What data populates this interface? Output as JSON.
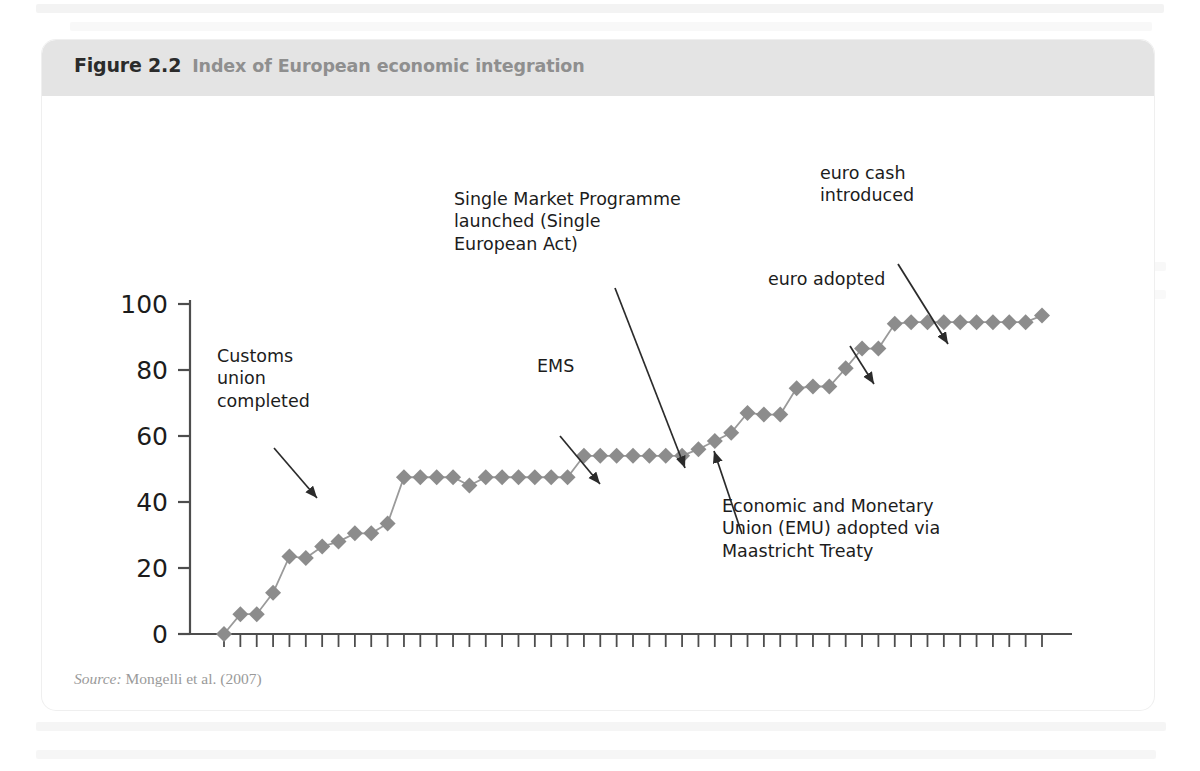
{
  "figure": {
    "number": "Figure 2.2",
    "caption": "Index of European economic integration",
    "source_label": "Source:",
    "source_text": " Mongelli et al. (2007)"
  },
  "colors": {
    "header_band": "#e4e4e4",
    "series_marker": "#8c8c8c",
    "series_line": "#9a9a9a",
    "axis": "#4d4d4d",
    "annotation_text": "#1c1c1c",
    "caption_grey": "#8f8f8f",
    "source_grey": "#9a9a9a"
  },
  "annotations": [
    {
      "name": "customs-union",
      "text": "Customs\nunion\ncompleted",
      "x": 175,
      "y": 305,
      "align": "left"
    },
    {
      "name": "ems",
      "text": "EMS",
      "x": 495,
      "y": 315,
      "align": "left"
    },
    {
      "name": "single-market-programme",
      "text": "Single Market Programme\nlaunched (Single\nEuropean Act)",
      "x": 412,
      "y": 148,
      "align": "left"
    },
    {
      "name": "euro-adopted",
      "text": "euro adopted",
      "x": 726,
      "y": 228,
      "align": "left"
    },
    {
      "name": "euro-cash-introduced",
      "text": "euro cash\nintroduced",
      "x": 778,
      "y": 122,
      "align": "left"
    },
    {
      "name": "emu-maastricht",
      "text": "Economic and Monetary\nUnion (EMU) adopted via\nMaastricht Treaty",
      "x": 680,
      "y": 455,
      "align": "left"
    }
  ],
  "chart_data": {
    "type": "line",
    "title": "Index of European economic integration",
    "xlabel": "",
    "ylabel": "",
    "ylim": [
      0,
      100
    ],
    "yticks": [
      0,
      20,
      40,
      60,
      80,
      100
    ],
    "xlim": [
      1957,
      2007
    ],
    "grid": false,
    "legend": false,
    "marker": "diamond",
    "tick_label_rotation": -90,
    "xtick_labels": [
      "1957",
      "1959",
      "1961",
      "1963",
      "1965",
      "1967",
      "1969",
      "1971",
      "1973",
      "1975",
      "1977",
      "1979",
      "1981",
      "1983",
      "1985",
      "1987",
      "1989",
      "1991",
      "1993",
      "1995",
      "1997",
      "1999",
      "2001",
      "2003",
      "2005",
      "2007"
    ],
    "x": [
      1957,
      1958,
      1959,
      1960,
      1961,
      1962,
      1963,
      1964,
      1965,
      1966,
      1967,
      1968,
      1969,
      1970,
      1971,
      1972,
      1973,
      1974,
      1975,
      1976,
      1977,
      1978,
      1979,
      1980,
      1981,
      1982,
      1983,
      1984,
      1985,
      1986,
      1987,
      1988,
      1989,
      1990,
      1991,
      1992,
      1993,
      1994,
      1995,
      1996,
      1997,
      1998,
      1999,
      2000,
      2001,
      2002,
      2003,
      2004,
      2005,
      2006,
      2007
    ],
    "values": [
      0,
      6,
      6,
      12.5,
      23.5,
      23,
      26.5,
      28,
      30.5,
      30.5,
      33.5,
      47.5,
      47.5,
      47.5,
      47.5,
      45,
      47.5,
      47.5,
      47.5,
      47.5,
      47.5,
      47.5,
      54,
      54,
      54,
      54,
      54,
      54,
      54,
      56,
      58.5,
      61,
      67,
      66.5,
      66.5,
      74.5,
      75,
      75,
      80.5,
      86.5,
      86.5,
      94,
      94.5,
      94.5,
      94.5,
      94.5,
      94.5,
      94.5,
      94.5,
      94.5,
      96.5
    ],
    "series": [
      {
        "name": "Index of European economic integration",
        "values": [
          0,
          6,
          6,
          12.5,
          23.5,
          23,
          26.5,
          28,
          30.5,
          30.5,
          33.5,
          47.5,
          47.5,
          47.5,
          47.5,
          45,
          47.5,
          47.5,
          47.5,
          47.5,
          47.5,
          47.5,
          54,
          54,
          54,
          54,
          54,
          54,
          54,
          56,
          58.5,
          61,
          67,
          66.5,
          66.5,
          74.5,
          75,
          75,
          80.5,
          86.5,
          86.5,
          94,
          94.5,
          94.5,
          94.5,
          94.5,
          94.5,
          94.5,
          94.5,
          94.5,
          96.5
        ]
      }
    ],
    "annotation_points": [
      {
        "label": "Customs union completed",
        "year": 1968,
        "value": 47.5
      },
      {
        "label": "EMS",
        "year": 1979,
        "value": 54
      },
      {
        "label": "Single Market Programme launched (Single European Act)",
        "year": 1986,
        "value": 56
      },
      {
        "label": "Economic and Monetary Union (EMU) adopted via Maastricht Treaty",
        "year": 1992,
        "value": 74.5
      },
      {
        "label": "euro adopted",
        "year": 1998,
        "value": 86.5
      },
      {
        "label": "euro cash introduced",
        "year": 2002,
        "value": 94.5
      }
    ]
  }
}
